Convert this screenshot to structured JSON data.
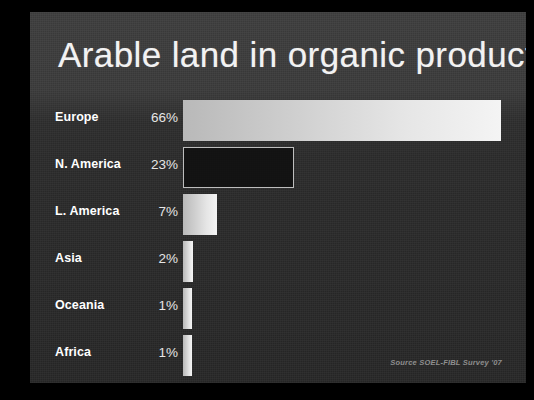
{
  "slide": {
    "title": "Arable land in organic production",
    "source_note": "Source SOEL-FIBL Survey '07",
    "background_color": "#2c2c2c",
    "text_color": "#ffffff",
    "frame_color": "#000000"
  },
  "chart_data": {
    "type": "bar",
    "orientation": "horizontal",
    "title": "Arable land in organic production",
    "xlabel": "",
    "ylabel": "",
    "xlim": [
      0,
      70
    ],
    "grid": false,
    "legend": "none",
    "value_suffix": "%",
    "annotation": "Source SOEL-FIBL Survey '07",
    "categories": [
      "Europe",
      "N. America",
      "L. America",
      "Asia",
      "Oceania",
      "Africa"
    ],
    "values": [
      66,
      23,
      7,
      2,
      1,
      1
    ],
    "value_labels": [
      "66%",
      "23%",
      "7%",
      "2%",
      "1%",
      "1%"
    ],
    "bars": [
      {
        "label": "Europe",
        "value": 66,
        "value_label": "66%",
        "style": "light-gradient",
        "color": "#e6e6e6"
      },
      {
        "label": "N. America",
        "value": 23,
        "value_label": "23%",
        "style": "dark-outlined",
        "color": "#0c0c0c",
        "outline_color": "#bdbdbd"
      },
      {
        "label": "L. America",
        "value": 7,
        "value_label": "7%",
        "style": "light-gradient",
        "color": "#e0e0e0"
      },
      {
        "label": "Asia",
        "value": 2,
        "value_label": "2%",
        "style": "light-gradient",
        "color": "#dcdcdc"
      },
      {
        "label": "Oceania",
        "value": 1,
        "value_label": "1%",
        "style": "light-gradient",
        "color": "#d8d8d8"
      },
      {
        "label": "Africa",
        "value": 1,
        "value_label": "1%",
        "style": "light-gradient",
        "color": "#d8d8d8"
      }
    ]
  }
}
